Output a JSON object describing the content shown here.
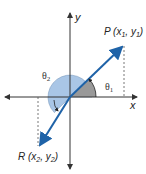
{
  "diagram": {
    "type": "coordinate-plane-angles",
    "axes": {
      "x_label": "x",
      "y_label": "y"
    },
    "points": {
      "P": {
        "label": "P (x",
        "sub1": "1",
        "mid": ", y",
        "sub2": "1",
        "end": ")"
      },
      "R": {
        "label": "R (x",
        "sub1": "2",
        "mid": ", y",
        "sub2": "2",
        "end": ")"
      }
    },
    "angles": {
      "theta1": {
        "symbol": "θ",
        "sub": "1"
      },
      "theta2": {
        "symbol": "θ",
        "sub": "2"
      }
    },
    "colors": {
      "line": "#1f63a8",
      "theta2_fill": "#a9c6e6",
      "theta1_fill": "#9a9a9a",
      "axis": "#333333"
    }
  }
}
